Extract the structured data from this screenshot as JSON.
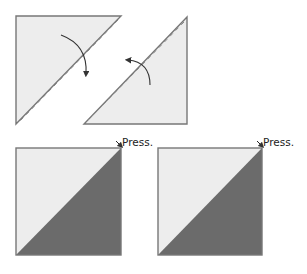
{
  "diagram": {
    "colors": {
      "light_fabric": "#ededed",
      "dark_fabric": "#6b6b6b",
      "outline": "#777777",
      "seam_dash": "#777777",
      "arrow": "#333333"
    },
    "step1": {
      "triangles": [
        {
          "name": "left-triangle",
          "orientation": "upper-left",
          "fold_arrow": "clockwise-down"
        },
        {
          "name": "right-triangle",
          "orientation": "lower-right",
          "fold_arrow": "counterclockwise-left"
        }
      ]
    },
    "step2": {
      "squares": [
        {
          "name": "left-square",
          "press_label": "Press."
        },
        {
          "name": "right-square",
          "press_label": "Press."
        }
      ]
    }
  }
}
